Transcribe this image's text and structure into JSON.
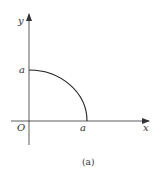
{
  "diagram": {
    "caption": "(a)",
    "axes": {
      "x_label": "x",
      "y_label": "y",
      "origin_label": "O"
    },
    "marks": {
      "x_intercept_label": "a",
      "y_intercept_label": "a"
    },
    "curve": {
      "description": "quarter ellipse/circle arc from (0,a) to (a,0) in first quadrant"
    },
    "colors": {
      "line": "#333333",
      "background": "#ffffff"
    }
  }
}
